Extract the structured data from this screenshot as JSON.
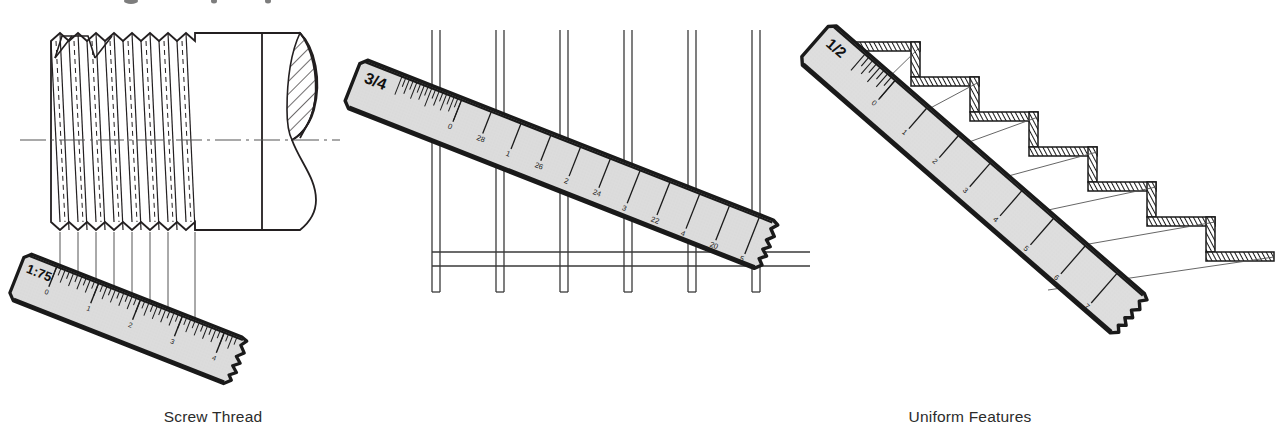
{
  "figure": {
    "title_fragment_cut_off_top": "",
    "background_color": "#ffffff",
    "ink_color": "#231f20",
    "ruler_face_color": "#dcdcdc",
    "ruler_edge_color": "#1a1a1a"
  },
  "panels": [
    {
      "id": "screw-thread",
      "caption": "Screw Thread",
      "ruler": {
        "scale_label": "1:75",
        "tick_numbers": [
          "0",
          "1",
          "2",
          "3",
          "4"
        ],
        "torn_end": true,
        "angle_deg": 22
      },
      "drawing": {
        "type": "screw-thread-elevation",
        "thread_crests": 8,
        "has_centerline": true,
        "has_hatched_break": true,
        "projection_lines": 8
      }
    },
    {
      "id": "uniform-features",
      "caption": "Uniform Features",
      "ruler": {
        "scale_label": "3/4",
        "tick_numbers": [
          "0",
          "28",
          "1",
          "26",
          "2",
          "24",
          "3",
          "22",
          "4",
          "20",
          "5",
          "18",
          "6"
        ],
        "torn_end": true,
        "angle_deg": 22
      },
      "drawing": {
        "type": "column-bay-elevation",
        "column_count": 6,
        "has_base_rail": true
      }
    },
    {
      "id": "stairs",
      "caption": "Stairs",
      "ruler": {
        "scale_label": "1/2",
        "tick_numbers": [
          "0",
          "1",
          "2",
          "3",
          "4",
          "5",
          "6",
          "7",
          "8"
        ],
        "torn_end": true,
        "angle_deg": 41
      },
      "drawing": {
        "type": "stair-section",
        "step_count": 8,
        "tread_hatched": true,
        "projection_lines": 8
      }
    }
  ]
}
